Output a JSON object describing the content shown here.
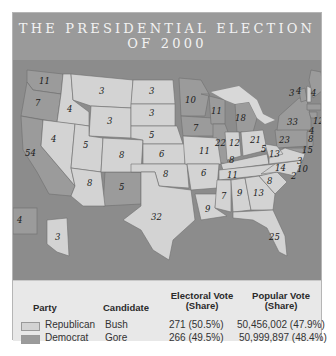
{
  "title": {
    "line1": "THE PRESIDENTIAL ELECTION",
    "line2": "OF 2000"
  },
  "colors": {
    "title_band": "#9a9a9a",
    "water": "#8c8c8c",
    "republican": "#d3d3d3",
    "democrat": "#9b9b9b",
    "panel": "#e8e8e8"
  },
  "map": {
    "states": [
      {
        "id": "WA",
        "party": "Democrat",
        "ev": "11"
      },
      {
        "id": "OR",
        "party": "Democrat",
        "ev": "7"
      },
      {
        "id": "CA",
        "party": "Democrat",
        "ev": "54"
      },
      {
        "id": "ID",
        "party": "Republican",
        "ev": "4"
      },
      {
        "id": "NV",
        "party": "Republican",
        "ev": "4"
      },
      {
        "id": "MT",
        "party": "Republican",
        "ev": "3"
      },
      {
        "id": "WY",
        "party": "Republican",
        "ev": "3"
      },
      {
        "id": "UT",
        "party": "Republican",
        "ev": "5"
      },
      {
        "id": "AZ",
        "party": "Republican",
        "ev": "8"
      },
      {
        "id": "CO",
        "party": "Republican",
        "ev": "8"
      },
      {
        "id": "NM",
        "party": "Democrat",
        "ev": "5"
      },
      {
        "id": "ND",
        "party": "Republican",
        "ev": "3"
      },
      {
        "id": "SD",
        "party": "Republican",
        "ev": "3"
      },
      {
        "id": "NE",
        "party": "Republican",
        "ev": "5"
      },
      {
        "id": "KS",
        "party": "Republican",
        "ev": "6"
      },
      {
        "id": "OK",
        "party": "Republican",
        "ev": "8"
      },
      {
        "id": "TX",
        "party": "Republican",
        "ev": "32"
      },
      {
        "id": "MN",
        "party": "Democrat",
        "ev": "10"
      },
      {
        "id": "IA",
        "party": "Democrat",
        "ev": "7"
      },
      {
        "id": "MO",
        "party": "Republican",
        "ev": "11"
      },
      {
        "id": "AR",
        "party": "Republican",
        "ev": "6"
      },
      {
        "id": "LA",
        "party": "Republican",
        "ev": "9"
      },
      {
        "id": "WI",
        "party": "Democrat",
        "ev": "11"
      },
      {
        "id": "IL",
        "party": "Democrat",
        "ev": "22"
      },
      {
        "id": "MI",
        "party": "Democrat",
        "ev": "18"
      },
      {
        "id": "IN",
        "party": "Republican",
        "ev": "12"
      },
      {
        "id": "OH",
        "party": "Republican",
        "ev": "21"
      },
      {
        "id": "KY",
        "party": "Republican",
        "ev": "8"
      },
      {
        "id": "TN",
        "party": "Republican",
        "ev": "11"
      },
      {
        "id": "MS",
        "party": "Republican",
        "ev": "7"
      },
      {
        "id": "AL",
        "party": "Republican",
        "ev": "9"
      },
      {
        "id": "GA",
        "party": "Republican",
        "ev": "13"
      },
      {
        "id": "FL",
        "party": "Republican",
        "ev": "25"
      },
      {
        "id": "SC",
        "party": "Republican",
        "ev": "8"
      },
      {
        "id": "NC",
        "party": "Republican",
        "ev": "14"
      },
      {
        "id": "VA",
        "party": "Republican",
        "ev": "13"
      },
      {
        "id": "WV",
        "party": "Republican",
        "ev": "5"
      },
      {
        "id": "PA",
        "party": "Democrat",
        "ev": "23"
      },
      {
        "id": "NY",
        "party": "Democrat",
        "ev": "33"
      },
      {
        "id": "VT",
        "party": "Democrat",
        "ev": "3"
      },
      {
        "id": "NH",
        "party": "Republican",
        "ev": "4"
      },
      {
        "id": "ME",
        "party": "Democrat",
        "ev": "4"
      },
      {
        "id": "MA",
        "party": "Democrat",
        "ev": "12"
      },
      {
        "id": "RI",
        "party": "Democrat",
        "ev": "4"
      },
      {
        "id": "CT",
        "party": "Democrat",
        "ev": "8"
      },
      {
        "id": "NJ",
        "party": "Democrat",
        "ev": "15"
      },
      {
        "id": "DE",
        "party": "Democrat",
        "ev": "3"
      },
      {
        "id": "MD",
        "party": "Democrat",
        "ev": "10"
      },
      {
        "id": "DC",
        "party": "Democrat",
        "ev": "2"
      },
      {
        "id": "HI",
        "party": "Democrat",
        "ev": "4"
      },
      {
        "id": "AK",
        "party": "Republican",
        "ev": "3"
      }
    ]
  },
  "legend": {
    "headers": {
      "party": "Party",
      "candidate": "Candidate",
      "electoral_line1": "Electoral Vote",
      "electoral_line2": "(Share)",
      "popular_line1": "Popular Vote",
      "popular_line2": "(Share)"
    },
    "rows": [
      {
        "party": "Republican",
        "candidate": "Bush",
        "electoral": "271 (50.5%)",
        "popular": "50,456,002 (47.9%)"
      },
      {
        "party": "Democrat",
        "candidate": "Gore",
        "electoral": "266 (49.5%)",
        "popular": "50,999,897 (48.4%)"
      }
    ]
  }
}
